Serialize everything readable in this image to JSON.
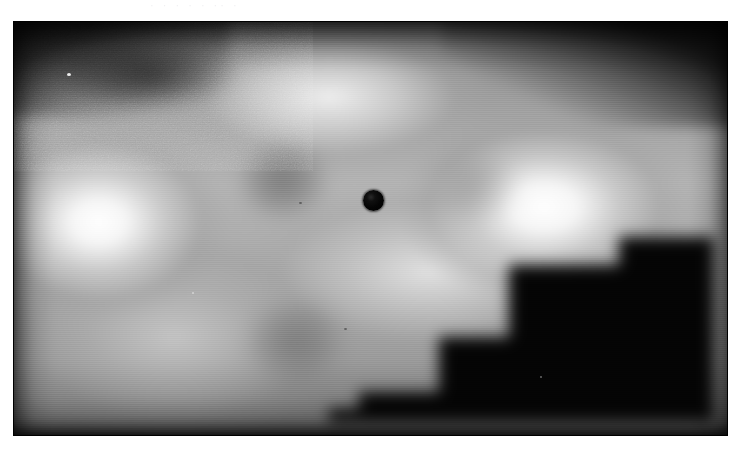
{
  "page": {
    "background_color": "#ffffff",
    "top_text_remnant": "· · ·  ·   ·  ·· ·",
    "note": "scanned figure page; body text cropped above"
  },
  "figure": {
    "name": "grayscale-intensity-map",
    "frame": {
      "x": 13,
      "y": 21,
      "width": 715,
      "height": 415
    },
    "colorspace": "grayscale",
    "border_color": "#000000",
    "background_color": "#050505"
  },
  "chart_data": {
    "type": "heatmap",
    "title": "",
    "subtitle": "",
    "xlabel": "",
    "ylabel": "",
    "colormap": "grayscale",
    "value_range": [
      0,
      255
    ],
    "grid": false,
    "legend": "none",
    "axis_ticks": [],
    "annotations": [
      {
        "name": "dark-spot",
        "label": "",
        "shape": "circle",
        "center_x": 373,
        "center_y": 200,
        "radius": 10.5,
        "value": 8,
        "color": "#050505"
      }
    ],
    "features": [
      {
        "name": "left-hotspot",
        "center_x": 113,
        "center_y": 236,
        "value": 255
      },
      {
        "name": "right-hotspot",
        "center_x": 558,
        "center_y": 221,
        "value": 255
      },
      {
        "name": "upper-centre-plateau",
        "center_x": 343,
        "center_y": 111,
        "value": 238
      },
      {
        "name": "centre-right-plateau",
        "center_x": 443,
        "center_y": 286,
        "value": 228
      },
      {
        "name": "centre-dark-patch",
        "center_x": 284,
        "center_y": 194,
        "value": 118
      },
      {
        "name": "lower-dark-patch",
        "center_x": 308,
        "center_y": 363,
        "value": 126
      },
      {
        "name": "upper-left-dark-band",
        "center_x": 165,
        "center_y": 96,
        "value": 46
      },
      {
        "name": "lower-right-dark-region",
        "center_x": 600,
        "center_y": 370,
        "value": 6
      },
      {
        "name": "top-border-vignette",
        "center_x": 370,
        "center_y": 28,
        "value": 4
      },
      {
        "name": "bottom-border-vignette",
        "center_x": 370,
        "center_y": 430,
        "value": 6
      }
    ]
  }
}
